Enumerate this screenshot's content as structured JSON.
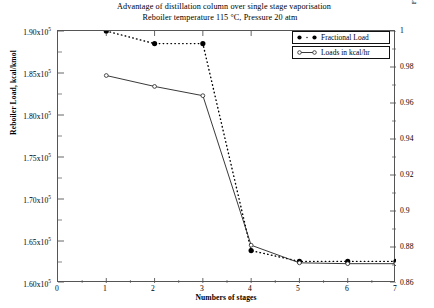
{
  "title": {
    "line1": "Advantage of distillation column over single stage vaporisation",
    "line2": "Reboiler temperature 115 °C, Pressure 20 atm"
  },
  "axes": {
    "x_label": "Numbers of stages",
    "y_left_label": "Reboiler Load, kcal/kmol",
    "y_right_label": "Fraction of load as single stage distillation load as basis",
    "x_ticks": [
      "0",
      "1",
      "2",
      "3",
      "4",
      "5",
      "6",
      "7"
    ],
    "y_left_ticks": [
      "1.60x10",
      "1.65x10",
      "1.70x10",
      "1.75x10",
      "1.80x10",
      "1.85x10",
      "1.90x10"
    ],
    "y_left_exponent": "5",
    "y_right_ticks": [
      "0.86",
      "0.88",
      "0.9",
      "0.92",
      "0.94",
      "0.96",
      "0.98",
      "1"
    ]
  },
  "legend": {
    "items": [
      {
        "label": "Fractional Load",
        "marker": "filled-circle",
        "line": "dotted"
      },
      {
        "label": "Loads in kcal/hr",
        "marker": "open-circle",
        "line": "solid"
      }
    ]
  },
  "colors": {
    "axis": "#555555",
    "series_fractional": "#000000",
    "series_loads": "#222222"
  },
  "chart_data": {
    "type": "line",
    "xlabel": "Numbers of stages",
    "ylabel": "Reboiler Load, kcal/kmol",
    "ylabel_right": "Fraction of load as single stage distillation load as basis",
    "x": [
      1,
      2,
      3,
      4,
      5,
      6,
      7
    ],
    "xlim": [
      0,
      7
    ],
    "ylim": [
      160000,
      190000
    ],
    "ylim_right": [
      0.86,
      1.0
    ],
    "grid": false,
    "legend_position": "top-right",
    "series": [
      {
        "name": "Fractional Load",
        "axis": "right",
        "marker": "filled-circle",
        "linestyle": "dotted",
        "values": [
          1.0,
          0.993,
          0.993,
          0.878,
          0.872,
          0.872,
          0.872
        ]
      },
      {
        "name": "Loads in kcal/hr",
        "axis": "left",
        "marker": "open-circle",
        "linestyle": "solid",
        "values": [
          184700,
          183400,
          182300,
          164500,
          162400,
          162300,
          162300
        ]
      }
    ]
  }
}
